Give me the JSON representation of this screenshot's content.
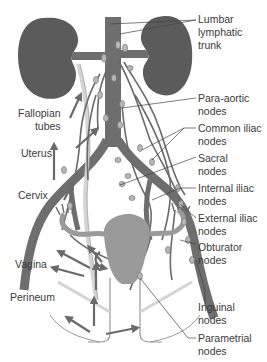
{
  "diagram": {
    "colors": {
      "organ_dark": "#5b5b5b",
      "vessel": "#6e6e6e",
      "node": "#b8b8b8",
      "uterus": "#9a9a9a",
      "ureter": "#d4d4d4",
      "leader_line": "#444444",
      "text": "#3a3a3a"
    },
    "labels_right": [
      {
        "id": "lumbar",
        "text": "Lumbar\nlymphatic\ntrunk"
      },
      {
        "id": "para_aortic",
        "text": "Para-aortic\nnodes"
      },
      {
        "id": "common_iliac",
        "text": "Common iliac\nnodes"
      },
      {
        "id": "sacral",
        "text": "Sacral\nnodes"
      },
      {
        "id": "internal_iliac",
        "text": "Internal iliac\nnodes"
      },
      {
        "id": "external_iliac",
        "text": "External iliac\nnodes"
      },
      {
        "id": "obturator",
        "text": "Obturator\nnodes"
      },
      {
        "id": "inguinal",
        "text": "Inguinal\nnodes"
      },
      {
        "id": "parametrial",
        "text": "Parametrial\nnodes"
      }
    ],
    "labels_left": [
      {
        "id": "fallopian",
        "text": "Fallopian\ntubes"
      },
      {
        "id": "uterus",
        "text": "Uterus"
      },
      {
        "id": "cervix",
        "text": "Cervix"
      },
      {
        "id": "vagina",
        "text": "Vagina"
      },
      {
        "id": "perineum",
        "text": "Perineum"
      }
    ]
  }
}
